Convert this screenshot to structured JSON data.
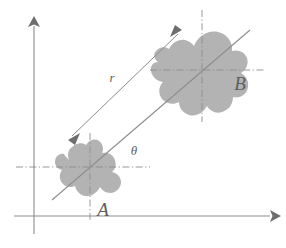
{
  "figure": {
    "background_color": "#ffffff",
    "axes": {
      "name": "cartesian-axes",
      "color": "#8d8d8d",
      "x_axis": {
        "label": "",
        "from": [
          14,
          216
        ],
        "to": [
          278,
          216
        ],
        "arrowhead": "right"
      },
      "y_axis": {
        "label": "",
        "from": [
          34,
          234
        ],
        "to": [
          34,
          18
        ],
        "arrowhead": "up"
      }
    },
    "shapes": [
      {
        "name": "shape-a",
        "label": "A",
        "label_position": [
          103,
          213
        ],
        "fill_color": "#b3b3b3",
        "center": [
          90,
          167
        ],
        "crosshair": {
          "style": "dash-dot",
          "color": "#8d8d8d",
          "horizontal": [
            16,
            167,
            150,
            167
          ],
          "vertical": [
            90,
            133,
            90,
            222
          ]
        }
      },
      {
        "name": "shape-b",
        "label": "B",
        "label_position": [
          238,
          86
        ],
        "fill_color": "#b3b3b3",
        "center": [
          202,
          70
        ],
        "crosshair": {
          "style": "dash-dot",
          "color": "#8d8d8d",
          "horizontal": [
            150,
            70,
            264,
            70
          ],
          "vertical": [
            202,
            10,
            202,
            122
          ]
        }
      }
    ],
    "annotations": [
      {
        "name": "radius-arrow",
        "label": "r",
        "label_position": [
          112,
          80
        ],
        "color": "#8d8d8d",
        "from": [
          70,
          138
        ],
        "to": [
          180,
          32
        ],
        "arrowheads": "both",
        "meaning": "distance r between centroid of A and centroid of B"
      },
      {
        "name": "angle-line",
        "label": "θ",
        "label_position": [
          133,
          152
        ],
        "color": "#8d8d8d",
        "from": [
          52,
          200
        ],
        "to": [
          250,
          30
        ],
        "arrowheads": "none",
        "meaning": "line through centroids of A and B making angle theta with horizontal"
      }
    ],
    "legend_note": ""
  }
}
